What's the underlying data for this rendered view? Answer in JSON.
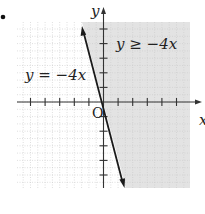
{
  "bullet": "•",
  "chart_data": {
    "type": "line",
    "title": "",
    "xlabel": "x",
    "ylabel": "y",
    "origin_label": "O",
    "xlim": [
      -5.8,
      5.9
    ],
    "ylim": [
      -5.8,
      5.5
    ],
    "grid": true,
    "tick_spacing": 1,
    "boundary_line": {
      "equation": "y = -4x",
      "slope": -4,
      "intercept": 0,
      "style": "solid",
      "arrows": "both",
      "points": [
        [
          -1.45,
          5.1
        ],
        [
          1.4,
          -5.6
        ]
      ]
    },
    "shaded_region": {
      "inequality": "y ≥ -4x",
      "side": "right of line",
      "color": "#e3e3e3"
    },
    "annotations": [
      {
        "text": "y = −4x",
        "near": "line, left of y-axis"
      },
      {
        "text": "y ≥ −4x",
        "near": "shaded region, upper right"
      }
    ]
  },
  "labels": {
    "y_axis": "y",
    "x_axis": "x",
    "origin": "O",
    "line_label": "y = −4x",
    "region_label": "y ≥ −4x"
  },
  "colors": {
    "shade": "#e3e3e3",
    "grid": "#c8c8c8",
    "axis": "#333333",
    "line": "#1a1a1a"
  }
}
